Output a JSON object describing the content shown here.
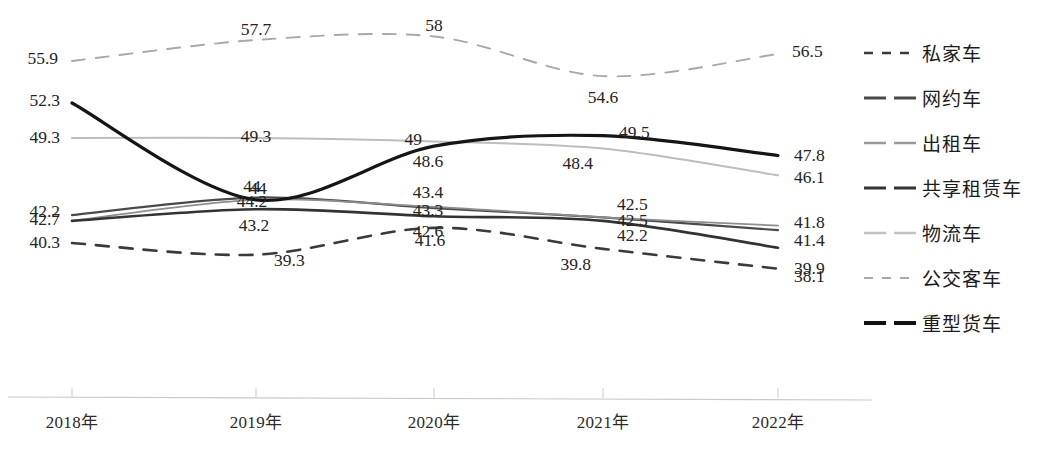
{
  "chart_data": {
    "type": "line",
    "title": "",
    "xlabel": "",
    "ylabel": "",
    "categories": [
      "2018年",
      "2019年",
      "2020年",
      "2021年",
      "2022年"
    ],
    "x_tick_labels": [
      "2018年",
      "2019年",
      "2020年",
      "2021年",
      "2022年"
    ],
    "ylim": [
      36.5,
      60.5
    ],
    "grid": false,
    "legend_position": "right",
    "series": [
      {
        "name": "私家车",
        "style": "dashed",
        "color": "#3a3a3a",
        "width": 2.6,
        "values": [
          40.3,
          39.3,
          41.6,
          39.8,
          38.1
        ],
        "labels": [
          "40.3",
          "39.3",
          "41.6",
          "39.8",
          "38.1"
        ]
      },
      {
        "name": "网约车",
        "style": "solid",
        "color": "#4a4a4a",
        "width": 2.2,
        "values": [
          42.7,
          44.2,
          43.3,
          42.5,
          41.4
        ],
        "labels": [
          "42.7",
          "44.2",
          "43.3",
          "42.5",
          "41.4"
        ]
      },
      {
        "name": "出租车",
        "style": "solid",
        "color": "#8e8e8e",
        "width": 1.8,
        "values": [
          42.2,
          44.0,
          43.4,
          42.5,
          41.8
        ],
        "labels": [
          "42.2",
          "44",
          "43.4",
          "42.5",
          "41.8"
        ]
      },
      {
        "name": "共享租赁车",
        "style": "solid",
        "color": "#333333",
        "width": 2.6,
        "values": [
          42.2,
          43.2,
          42.6,
          42.2,
          39.9
        ],
        "labels": [
          "42.2",
          "43.2",
          "42.6",
          "42.2",
          "39.9"
        ]
      },
      {
        "name": "物流车",
        "style": "solid",
        "color": "#bdbdbd",
        "width": 2.0,
        "values": [
          49.3,
          49.3,
          49.0,
          48.4,
          46.1
        ],
        "labels": [
          "49.3",
          "49.3",
          "49",
          "48.4",
          "46.1"
        ]
      },
      {
        "name": "公交客车",
        "style": "dashed",
        "color": "#a8a8a8",
        "width": 1.9,
        "values": [
          55.9,
          57.7,
          58.0,
          54.6,
          56.5
        ],
        "labels": [
          "55.9",
          "57.7",
          "58",
          "54.6",
          "56.5"
        ]
      },
      {
        "name": "重型货车",
        "style": "solid",
        "color": "#151515",
        "width": 3.2,
        "values": [
          52.3,
          44.0,
          48.6,
          49.5,
          47.8
        ],
        "labels": [
          "52.3",
          "44",
          "48.6",
          "49.5",
          "47.8"
        ]
      }
    ],
    "legend": [
      {
        "name": "私家车",
        "style": "dashed",
        "color": "#3a3a3a",
        "width": 2.6
      },
      {
        "name": "网约车",
        "style": "solid",
        "color": "#4a4a4a",
        "width": 3.0
      },
      {
        "name": "出租车",
        "style": "solid",
        "color": "#9a9a9a",
        "width": 2.4
      },
      {
        "name": "共享租赁车",
        "style": "solid",
        "color": "#333333",
        "width": 3.2
      },
      {
        "name": "物流车",
        "style": "solid",
        "color": "#c2c2c2",
        "width": 2.6
      },
      {
        "name": "公交客车",
        "style": "dashed",
        "color": "#a8a8a8",
        "width": 2.0
      },
      {
        "name": "重型货车",
        "style": "solid",
        "color": "#111111",
        "width": 3.8
      }
    ],
    "annotations": []
  },
  "axis": {
    "line_color": "#c9c9c9",
    "tick_color": "#cfcfcf"
  },
  "layout": {
    "x_positions": [
      72,
      256,
      434,
      603,
      778
    ],
    "axis_y": 397,
    "value_ref": {
      "value": 52.3,
      "y": 103
    },
    "px_per_unit": 11.67,
    "label_placements": [
      {
        "series": "公交客车",
        "i": 0,
        "dx": -14,
        "dy": -2,
        "anchor": "end"
      },
      {
        "series": "公交客车",
        "i": 1,
        "dx": 0,
        "dy": -10,
        "anchor": "mid"
      },
      {
        "series": "公交客车",
        "i": 2,
        "dx": 0,
        "dy": -10,
        "anchor": "mid"
      },
      {
        "series": "公交客车",
        "i": 3,
        "dx": 0,
        "dy": 22,
        "anchor": "mid"
      },
      {
        "series": "公交客车",
        "i": 4,
        "dx": 14,
        "dy": -2,
        "anchor": "start"
      },
      {
        "series": "重型货车",
        "i": 0,
        "dx": -12,
        "dy": -2,
        "anchor": "end"
      },
      {
        "series": "重型货车",
        "i": 1,
        "dx": 2,
        "dy": -11,
        "anchor": "mid"
      },
      {
        "series": "重型货车",
        "i": 2,
        "dx": -6,
        "dy": 16,
        "anchor": "mid"
      },
      {
        "series": "重型货车",
        "i": 3,
        "dx": 16,
        "dy": -3,
        "anchor": "start"
      },
      {
        "series": "重型货车",
        "i": 4,
        "dx": 16,
        "dy": 0,
        "anchor": "start"
      },
      {
        "series": "物流车",
        "i": 0,
        "dx": -12,
        "dy": 0,
        "anchor": "end"
      },
      {
        "series": "物流车",
        "i": 1,
        "dx": 0,
        "dy": -1,
        "anchor": "mid"
      },
      {
        "series": "物流车",
        "i": 2,
        "dx": -12,
        "dy": -2,
        "anchor": "end"
      },
      {
        "series": "物流车",
        "i": 3,
        "dx": -10,
        "dy": 15,
        "anchor": "end"
      },
      {
        "series": "物流车",
        "i": 4,
        "dx": 16,
        "dy": 3,
        "anchor": "start"
      },
      {
        "series": "出租车",
        "i": 0,
        "dx": -12,
        "dy": -9,
        "anchor": "end"
      },
      {
        "series": "出租车",
        "i": 1,
        "dx": -4,
        "dy": -13,
        "anchor": "mid"
      },
      {
        "series": "出租车",
        "i": 2,
        "dx": -6,
        "dy": -14,
        "anchor": "mid"
      },
      {
        "series": "出租车",
        "i": 3,
        "dx": 14,
        "dy": -12,
        "anchor": "start"
      },
      {
        "series": "出租车",
        "i": 4,
        "dx": 16,
        "dy": -3,
        "anchor": "start"
      },
      {
        "series": "网约车",
        "i": 0,
        "dx": -12,
        "dy": 5,
        "anchor": "end"
      },
      {
        "series": "网约车",
        "i": 1,
        "dx": -4,
        "dy": 4,
        "anchor": "mid"
      },
      {
        "series": "网约车",
        "i": 2,
        "dx": -6,
        "dy": 3,
        "anchor": "mid"
      },
      {
        "series": "网约车",
        "i": 3,
        "dx": 14,
        "dy": 4,
        "anchor": "start"
      },
      {
        "series": "网约车",
        "i": 4,
        "dx": 16,
        "dy": 11,
        "anchor": "start"
      },
      {
        "series": "共享租赁车",
        "i": 1,
        "dx": -2,
        "dy": 17,
        "anchor": "mid"
      },
      {
        "series": "共享租赁车",
        "i": 2,
        "dx": -6,
        "dy": 16,
        "anchor": "mid"
      },
      {
        "series": "共享租赁车",
        "i": 3,
        "dx": 14,
        "dy": 15,
        "anchor": "start"
      },
      {
        "series": "共享租赁车",
        "i": 4,
        "dx": 16,
        "dy": 21,
        "anchor": "start"
      },
      {
        "series": "私家车",
        "i": 0,
        "dx": -12,
        "dy": 0,
        "anchor": "end"
      },
      {
        "series": "私家车",
        "i": 1,
        "dx": 18,
        "dy": 6,
        "anchor": "start"
      },
      {
        "series": "私家车",
        "i": 2,
        "dx": -4,
        "dy": 13,
        "anchor": "mid"
      },
      {
        "series": "私家车",
        "i": 3,
        "dx": -12,
        "dy": 16,
        "anchor": "end"
      },
      {
        "series": "私家车",
        "i": 4,
        "dx": 16,
        "dy": 8,
        "anchor": "start"
      }
    ]
  }
}
